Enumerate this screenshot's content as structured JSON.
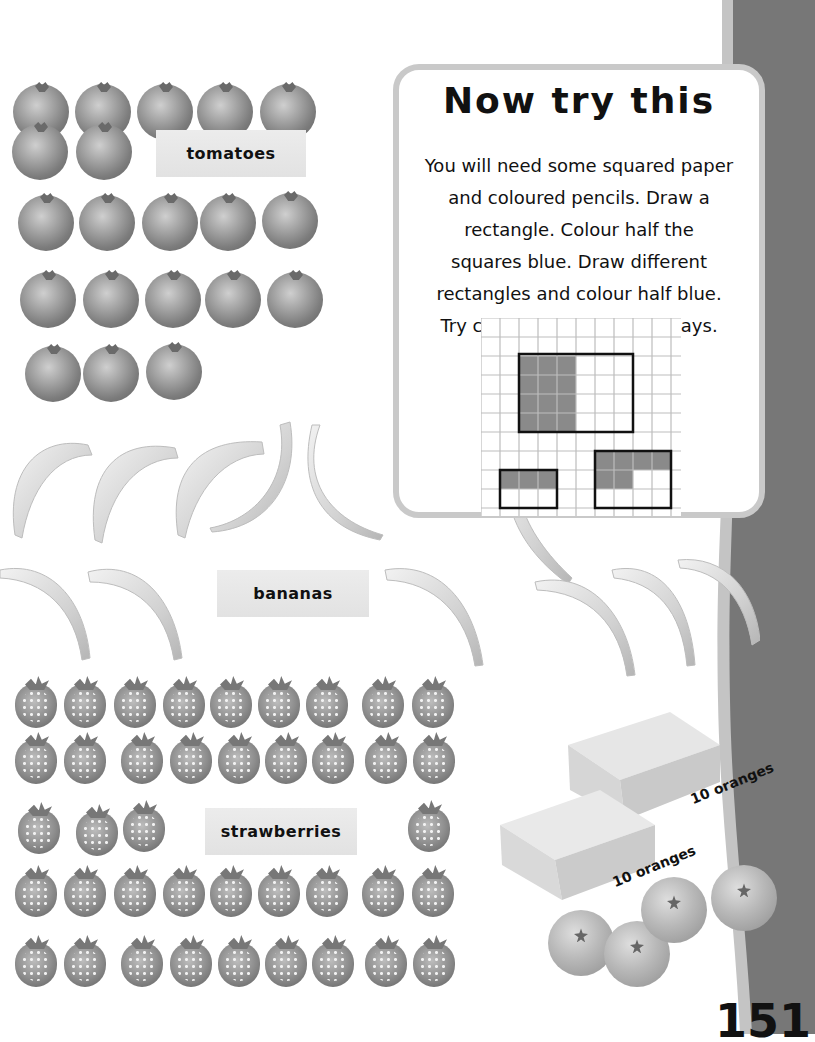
{
  "page": {
    "number": "151"
  },
  "labels": {
    "tomatoes": "tomatoes",
    "bananas": "bananas",
    "strawberries": "strawberries"
  },
  "counts": {
    "tomatoes": 20,
    "bananas": 12,
    "strawberries": 40,
    "orange_boxes": 2,
    "loose_oranges": 4
  },
  "activity": {
    "title": "Now try this",
    "lines": [
      "You will need some squared paper",
      "and coloured pencils. Draw a",
      "rectangle. Colour half the",
      "squares blue. Draw different",
      "rectangles and colour half blue.",
      "Try colouring in different ways."
    ]
  },
  "boxes": [
    {
      "label": "10 oranges"
    },
    {
      "label": "10 oranges"
    }
  ],
  "colors": {
    "band": "#777777",
    "band_edge": "#c4c4c4",
    "card_border": "#c9c9c9",
    "shaded_square": "#8a8a8a"
  }
}
